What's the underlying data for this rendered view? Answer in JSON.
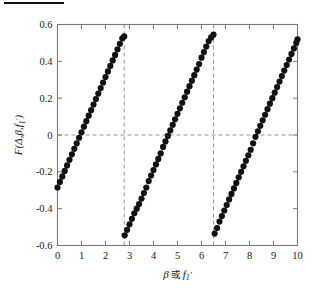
{
  "figure": {
    "background": "#ffffff",
    "marker_color": "#111111",
    "axis_color": "#7a7a7a",
    "dash_color": "#8a8a8a",
    "top_rule": true
  },
  "axes": {
    "x_ticks": [
      "0",
      "1",
      "2",
      "3",
      "4",
      "5",
      "6",
      "7",
      "8",
      "9",
      "10"
    ],
    "y_ticks": [
      "0.6",
      "0.4",
      "0.2",
      "0",
      "-0.2",
      "-0.4",
      "-0.6"
    ],
    "xlabel_parts": {
      "beta": "β",
      "or": "或",
      "f": "f",
      "sub": "1",
      "prime": "′"
    },
    "ylabel_parts": {
      "F": "F",
      "open": "(",
      "delta": "Δ",
      "comma1": ",",
      "beta": "β",
      "comma2": ",",
      "f": "f",
      "sub": "1",
      "prime": "′",
      "close": ")"
    },
    "xlabel_text": "β 或 f₁′",
    "ylabel_text": "F(Δ,β,f₁′)"
  },
  "chart_data": {
    "type": "scatter",
    "title": "",
    "xlabel": "β 或 f₁′",
    "ylabel": "F(Δ,β,f₁′)",
    "xlim": [
      0,
      10
    ],
    "ylim": [
      -0.6,
      0.6
    ],
    "xticks": [
      0,
      1,
      2,
      3,
      4,
      5,
      6,
      7,
      8,
      9,
      10
    ],
    "yticks": [
      -0.6,
      -0.4,
      -0.2,
      0,
      0.2,
      0.4,
      0.6
    ],
    "grid": false,
    "legend": null,
    "marker": "filled-circle",
    "marker_size": 3.1,
    "annotations": {
      "zero_line": {
        "type": "horizontal-dashed",
        "y": 0
      },
      "asymptotes": [
        {
          "type": "vertical-dashed",
          "x": 2.78
        },
        {
          "type": "vertical-dashed",
          "x": 6.5
        }
      ]
    },
    "zero_crossings": [
      0.95,
      4.6,
      8.25
    ],
    "series": [
      {
        "name": "branch-1",
        "x": [
          0.0,
          0.1,
          0.2,
          0.3,
          0.4,
          0.5,
          0.6,
          0.7,
          0.8,
          0.9,
          1.0,
          1.1,
          1.2,
          1.3,
          1.4,
          1.5,
          1.6,
          1.7,
          1.8,
          1.9,
          2.0,
          2.1,
          2.2,
          2.3,
          2.4,
          2.5,
          2.6,
          2.7,
          2.78
        ],
        "y": [
          -0.285,
          -0.255,
          -0.225,
          -0.195,
          -0.165,
          -0.135,
          -0.105,
          -0.075,
          -0.045,
          -0.015,
          0.015,
          0.045,
          0.075,
          0.105,
          0.135,
          0.165,
          0.195,
          0.225,
          0.255,
          0.285,
          0.315,
          0.345,
          0.375,
          0.405,
          0.435,
          0.465,
          0.495,
          0.525,
          0.535
        ]
      },
      {
        "name": "branch-2",
        "x": [
          2.8,
          2.9,
          3.0,
          3.1,
          3.2,
          3.3,
          3.4,
          3.5,
          3.6,
          3.7,
          3.8,
          3.9,
          4.0,
          4.1,
          4.2,
          4.3,
          4.4,
          4.5,
          4.6,
          4.7,
          4.8,
          4.9,
          5.0,
          5.1,
          5.2,
          5.3,
          5.4,
          5.5,
          5.6,
          5.7,
          5.8,
          5.9,
          6.0,
          6.1,
          6.2,
          6.3,
          6.4,
          6.5
        ],
        "y": [
          -0.545,
          -0.515,
          -0.485,
          -0.455,
          -0.425,
          -0.4,
          -0.375,
          -0.345,
          -0.315,
          -0.285,
          -0.25,
          -0.22,
          -0.19,
          -0.16,
          -0.13,
          -0.1,
          -0.065,
          -0.035,
          -0.005,
          0.025,
          0.055,
          0.085,
          0.115,
          0.145,
          0.175,
          0.205,
          0.235,
          0.265,
          0.295,
          0.325,
          0.355,
          0.385,
          0.42,
          0.45,
          0.48,
          0.51,
          0.53,
          0.545
        ]
      },
      {
        "name": "branch-3",
        "x": [
          6.55,
          6.65,
          6.75,
          6.85,
          6.95,
          7.05,
          7.15,
          7.25,
          7.35,
          7.45,
          7.55,
          7.65,
          7.75,
          7.85,
          7.95,
          8.05,
          8.15,
          8.25,
          8.35,
          8.45,
          8.55,
          8.65,
          8.75,
          8.85,
          8.95,
          9.05,
          9.15,
          9.25,
          9.35,
          9.45,
          9.55,
          9.65,
          9.75,
          9.85,
          9.95,
          10.0
        ],
        "y": [
          -0.535,
          -0.505,
          -0.47,
          -0.44,
          -0.41,
          -0.38,
          -0.35,
          -0.32,
          -0.29,
          -0.26,
          -0.23,
          -0.2,
          -0.17,
          -0.14,
          -0.11,
          -0.08,
          -0.045,
          -0.01,
          0.02,
          0.05,
          0.08,
          0.11,
          0.14,
          0.17,
          0.2,
          0.23,
          0.26,
          0.29,
          0.32,
          0.35,
          0.38,
          0.41,
          0.44,
          0.47,
          0.5,
          0.52
        ]
      }
    ]
  }
}
